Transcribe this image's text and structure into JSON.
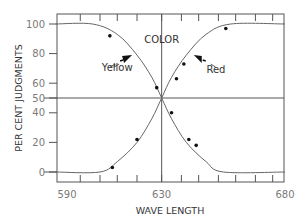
{
  "chart_data": {
    "type": "line",
    "title": "",
    "xlabel": "WAVE LENGTH",
    "ylabel": "PER CENT JUDGMENTS",
    "xlim": [
      587,
      680
    ],
    "ylim": [
      -10,
      107
    ],
    "x_tick_labels": [
      "590",
      "630",
      "680"
    ],
    "x_ticks": [
      590,
      630,
      680
    ],
    "y_tick_labels": [
      "0",
      "20",
      "40",
      "50",
      "60",
      "80",
      "100"
    ],
    "y_ticks": [
      0,
      20,
      40,
      50,
      60,
      80,
      100
    ],
    "grid": false,
    "reference_lines": {
      "horizontal": 50,
      "vertical": 630
    },
    "annotations": [
      {
        "text": "COLOR",
        "x": 630,
        "y": 87
      },
      {
        "text": "Yellow",
        "x": 612,
        "y": 68,
        "arrow_to": [
          618,
          79
        ]
      },
      {
        "text": "Red",
        "x": 652,
        "y": 67,
        "arrow_to": [
          643,
          79
        ]
      }
    ],
    "series": [
      {
        "name": "Yellow",
        "curve": [
          [
            587,
            100
          ],
          [
            602,
            100
          ],
          [
            612,
            93
          ],
          [
            620,
            79
          ],
          [
            626,
            64
          ],
          [
            630,
            50
          ],
          [
            634,
            36
          ],
          [
            640,
            20
          ],
          [
            648,
            7
          ],
          [
            655,
            0
          ],
          [
            680,
            0
          ]
        ],
        "points": [
          [
            609,
            92
          ],
          [
            628,
            57
          ],
          [
            634,
            40
          ],
          [
            641,
            22
          ],
          [
            644,
            18
          ]
        ]
      },
      {
        "name": "Red",
        "curve": [
          [
            587,
            0
          ],
          [
            605,
            0
          ],
          [
            612,
            7
          ],
          [
            620,
            20
          ],
          [
            626,
            36
          ],
          [
            630,
            50
          ],
          [
            634,
            64
          ],
          [
            640,
            79
          ],
          [
            648,
            93
          ],
          [
            658,
            100
          ],
          [
            680,
            100
          ]
        ],
        "points": [
          [
            610,
            3
          ],
          [
            620,
            22
          ],
          [
            636,
            63
          ],
          [
            639,
            73
          ],
          [
            656,
            97
          ]
        ]
      }
    ]
  }
}
